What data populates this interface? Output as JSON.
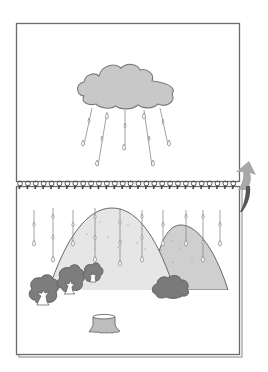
{
  "illustration": {
    "title": "Flip notebook: rain cloud above, rain on hills below",
    "colors": {
      "background": "#ffffff",
      "page_border": "#6a6a6a",
      "page_shadow": "#9a9a9a",
      "cloud_fill": "#c8c8c8",
      "cloud_stroke": "#7a7a7a",
      "rain_stroke": "#8a8a8a",
      "big_hill_fill": "#e6e6e6",
      "small_hill_fill": "#cfcfcf",
      "hill_stroke": "#6a6a6a",
      "tree_fill": "#7d7d7d",
      "bush_fill": "#7a7a7a",
      "stump_fill": "#bdbdbd",
      "arrow_fill": "#a8a8a8",
      "arrow_dark": "#555555",
      "spiral": "#444444"
    },
    "top_page": {
      "label": "cloud page"
    },
    "bottom_page": {
      "label": "hills page"
    },
    "spiral": {
      "loop_count": 28
    },
    "arrow": {
      "icon": "curved-flip-arrow-icon",
      "direction": "up"
    },
    "elements": {
      "cloud": "rain-cloud",
      "hills": [
        "big-hill",
        "small-hill"
      ],
      "trees": [
        "tree-large",
        "tree-medium",
        "tree-small"
      ],
      "bush": "bush",
      "stump": "tree-stump"
    }
  }
}
